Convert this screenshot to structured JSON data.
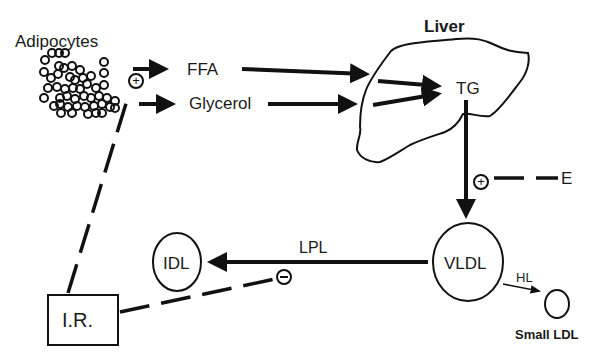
{
  "diagram": {
    "colors": {
      "stroke": "#111111",
      "text": "#1a1a1a",
      "background": "#ffffff"
    },
    "nodes": {
      "adipocytes": {
        "label": "Adipocytes"
      },
      "ffa": {
        "label": "FFA"
      },
      "glycerol": {
        "label": "Glycerol"
      },
      "liver": {
        "label": "Liver"
      },
      "tg": {
        "label": "TG"
      },
      "e": {
        "label": "E"
      },
      "vldl": {
        "label": "VLDL"
      },
      "idl": {
        "label": "IDL"
      },
      "small_ldl": {
        "label": "Small LDL"
      },
      "ir": {
        "label": "I.R."
      }
    },
    "edges": {
      "lpl": {
        "label": "LPL"
      },
      "hl": {
        "label": "HL"
      }
    },
    "modifiers": {
      "plus_adipocytes": {
        "symbol": "+"
      },
      "plus_vldl_secretion": {
        "symbol": "+"
      },
      "minus_lpl": {
        "symbol": "−"
      }
    }
  }
}
